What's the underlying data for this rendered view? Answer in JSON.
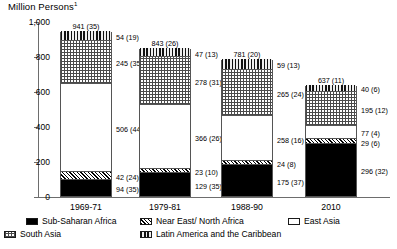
{
  "axis_title": "Million Persons",
  "axis_title_footnote": "1",
  "chart_data": {
    "type": "bar",
    "subtype": "stacked-bar",
    "title": "Million Persons",
    "xlabel": "",
    "ylabel": "Million Persons",
    "ylim": [
      0,
      1000
    ],
    "yticks": [
      0,
      200,
      400,
      600,
      800,
      1000
    ],
    "ytick_labels": [
      "0",
      "200",
      "400",
      "600",
      "800",
      "1,000"
    ],
    "grid": false,
    "legend_position": "bottom",
    "categories": [
      "1969-71",
      "1979-81",
      "1988-90",
      "2010"
    ],
    "totals": [
      941,
      843,
      781,
      637
    ],
    "total_percents": [
      35,
      26,
      20,
      11
    ],
    "total_labels": [
      "941 (35)",
      "843 (26)",
      "781 (20)",
      "637 (11)"
    ],
    "series": [
      {
        "name": "Sub-Saharan Africa",
        "fill": "solid-black",
        "values": [
          94,
          129,
          175,
          296
        ],
        "percents": [
          35,
          35,
          37,
          32
        ],
        "labels": [
          "94 (35)",
          "129 (35)",
          "175 (37)",
          "296 (32)"
        ]
      },
      {
        "name": "Near East/ North Africa",
        "fill": "diagonal-hatch",
        "values": [
          42,
          23,
          24,
          29
        ],
        "percents": [
          24,
          10,
          8,
          6
        ],
        "labels": [
          "42 (24)",
          "23 (10)",
          "24 (8)",
          "29 (6)"
        ]
      },
      {
        "name": "East Asia",
        "fill": "white",
        "values": [
          506,
          366,
          258,
          77
        ],
        "percents": [
          44,
          26,
          16,
          4
        ],
        "labels": [
          "506 (44)",
          "366 (26)",
          "258 (16)",
          "77 (4)"
        ]
      },
      {
        "name": "South Asia",
        "fill": "dotted",
        "values": [
          245,
          278,
          265,
          195
        ],
        "percents": [
          35,
          31,
          24,
          12
        ],
        "labels": [
          "245 (35)",
          "278 (31)",
          "265 (24)",
          "195 (12)"
        ]
      },
      {
        "name": "Latin America and the Caribbean",
        "fill": "vertical-stripe",
        "values": [
          54,
          47,
          59,
          40
        ],
        "percents": [
          19,
          13,
          13,
          6
        ],
        "labels": [
          "54 (19)",
          "47 (13)",
          "59 (13)",
          "40 (6)"
        ]
      }
    ]
  },
  "legend": {
    "items": [
      {
        "label": "Sub-Saharan Africa",
        "fill": "solid-black"
      },
      {
        "label": "Near East/ North Africa",
        "fill": "diagonal-hatch"
      },
      {
        "label": "East Asia",
        "fill": "white"
      },
      {
        "label": "South Asia",
        "fill": "dotted"
      },
      {
        "label": "Latin America and the Caribbean",
        "fill": "vertical-stripe"
      }
    ]
  },
  "colors": {
    "axis": "#6d6d6d",
    "text": "#000000",
    "series_solid": "#000000",
    "background": "#ffffff"
  }
}
